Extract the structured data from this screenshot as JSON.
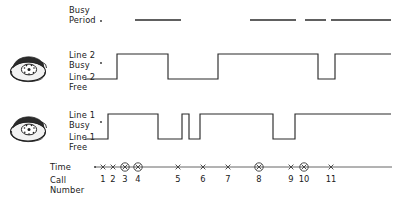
{
  "figure": {
    "type": "timing-diagram"
  },
  "rows": {
    "busy_period": {
      "label_line1": "Busy",
      "label_line2": "Period",
      "dot_marker": "·"
    },
    "line2": {
      "top_label_line1": "Line 2",
      "top_label_line2": "Busy",
      "bottom_label_line1": "Line 2",
      "bottom_label_line2": "Free",
      "icon": "telephone-icon",
      "dot_marker": "·"
    },
    "line1": {
      "top_label_line1": "Line 1",
      "top_label_line2": "Busy",
      "bottom_label_line1": "Line 1",
      "bottom_label_line2": "Free",
      "icon": "telephone-icon",
      "dot_marker": "·"
    },
    "time_axis": {
      "label": "Time",
      "call_label_line1": "Call",
      "call_label_line2": "Number"
    }
  },
  "chart_data": {
    "type": "line",
    "xlabel": "Time",
    "ylabel": "",
    "grid": false,
    "legend_position": "left-labels",
    "x_axis": {
      "start_px": 95,
      "end_px": 392,
      "baseline_y_px": 167
    },
    "call_markers": [
      {
        "number": "1",
        "x": 103,
        "circled": false
      },
      {
        "number": "2",
        "x": 113,
        "circled": false
      },
      {
        "number": "3",
        "x": 125,
        "circled": true
      },
      {
        "number": "4",
        "x": 138,
        "circled": true
      },
      {
        "number": "5",
        "x": 178,
        "circled": false
      },
      {
        "number": "6",
        "x": 203,
        "circled": false
      },
      {
        "number": "7",
        "x": 228,
        "circled": false
      },
      {
        "number": "8",
        "x": 259,
        "circled": true
      },
      {
        "number": "9",
        "x": 291,
        "circled": false
      },
      {
        "number": "10",
        "x": 304,
        "circled": true
      },
      {
        "number": "11",
        "x": 331,
        "circled": false
      }
    ],
    "series": [
      {
        "name": "Busy Period",
        "render": "segments",
        "y_px": 20,
        "segments": [
          {
            "x_start": 135,
            "x_end": 181
          },
          {
            "x_start": 250,
            "x_end": 296
          },
          {
            "x_start": 305,
            "x_end": 326
          },
          {
            "x_start": 331,
            "x_end": 391
          }
        ]
      },
      {
        "name": "Line 2",
        "render": "square-wave",
        "y_free_px": 79,
        "y_busy_px": 54,
        "x_start": 85,
        "x_end": 391,
        "transitions": [
          {
            "x": 117,
            "to": "busy"
          },
          {
            "x": 168,
            "to": "free"
          },
          {
            "x": 218,
            "to": "busy"
          },
          {
            "x": 318,
            "to": "free"
          },
          {
            "x": 335,
            "to": "busy"
          }
        ],
        "initial_state": "free",
        "final_state": "busy"
      },
      {
        "name": "Line 1",
        "render": "square-wave",
        "y_free_px": 139,
        "y_busy_px": 114,
        "x_start": 85,
        "x_end": 391,
        "transitions": [
          {
            "x": 108,
            "to": "busy"
          },
          {
            "x": 158,
            "to": "free"
          },
          {
            "x": 182,
            "to": "busy"
          },
          {
            "x": 189,
            "to": "free"
          },
          {
            "x": 200,
            "to": "busy"
          },
          {
            "x": 273,
            "to": "free"
          },
          {
            "x": 295,
            "to": "busy"
          }
        ],
        "initial_state": "free",
        "final_state": "busy"
      }
    ]
  },
  "colors": {
    "ink": "#2b2b2b",
    "axis": "#555555",
    "background": "#ffffff"
  }
}
